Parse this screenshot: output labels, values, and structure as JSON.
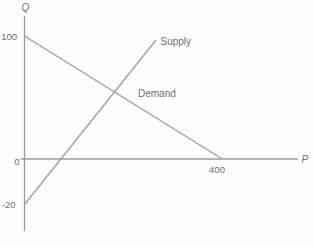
{
  "figure": {
    "background": "#fdfdfd",
    "line_color": "#9d9d9d",
    "text_color": "#6e6e6e"
  },
  "labels": {
    "q_axis": "Q",
    "p_axis": "P",
    "tick_100": "100",
    "tick_0": "0",
    "tick_neg20": "-20",
    "tick_400": "400",
    "supply": "Supply",
    "demand": "Demand"
  },
  "chart_data": {
    "type": "line",
    "title": "",
    "xlabel": "P",
    "ylabel": "Q",
    "grid": false,
    "legend": "inline-labels",
    "x_axis": {
      "ticks": [
        {
          "value": 0,
          "label": "0"
        },
        {
          "value": 400,
          "label": "400"
        }
      ]
    },
    "y_axis": {
      "ticks": [
        {
          "value": 100,
          "label": "100"
        },
        {
          "value": 0,
          "label": "0"
        },
        {
          "value": -20,
          "label": "-20"
        }
      ]
    },
    "series": [
      {
        "name": "Demand",
        "points": [
          {
            "P": 0,
            "Q": 100
          },
          {
            "P": 400,
            "Q": 0
          }
        ],
        "shape": "straight line, downward sloping"
      },
      {
        "name": "Supply",
        "points": [
          {
            "P": 0,
            "Q": -20
          }
        ],
        "shape": "straight line, upward sloping, crosses Q=0 left of demand intercept and crosses demand at about Q=55"
      }
    ]
  },
  "geometry": {
    "canvas": {
      "width": 313,
      "height": 247
    },
    "lines": {
      "y_axis": {
        "x1": 24.5,
        "y1": 16,
        "x2": 24.5,
        "y2": 231
      },
      "x_axis": {
        "x1": 20.5,
        "y1": 159,
        "x2": 298,
        "y2": 159
      },
      "demand": {
        "x1": 24.5,
        "y1": 36,
        "x2": 221.5,
        "y2": 158.5
      },
      "supply": {
        "x1": 24.5,
        "y1": 204.5,
        "x2": 156,
        "y2": 40
      }
    },
    "labels": {
      "q_axis": {
        "x": 25.5,
        "y": 11
      },
      "p_axis": {
        "x": 301.5,
        "y": 162.5
      },
      "tick_100": {
        "x": 17,
        "y": 40
      },
      "tick_0": {
        "x": 19.5,
        "y": 164.5
      },
      "tick_neg20": {
        "x": 15.5,
        "y": 208
      },
      "tick_400": {
        "x": 217,
        "y": 172.5
      },
      "supply": {
        "x": 160.5,
        "y": 45
      },
      "demand": {
        "x": 138,
        "y": 96.5
      }
    }
  }
}
